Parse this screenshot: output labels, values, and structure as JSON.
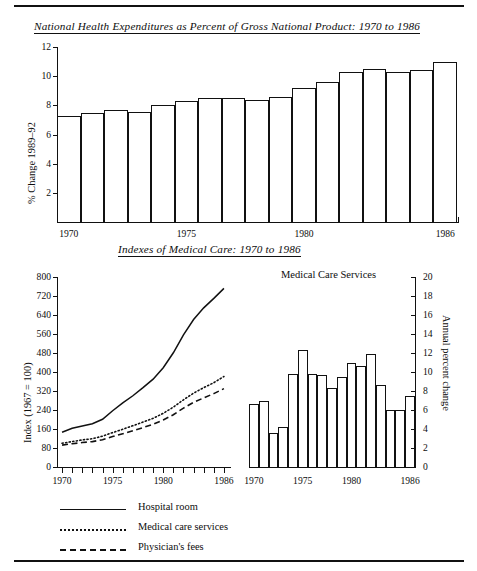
{
  "document": {
    "rule_top": "horizontal-rule",
    "rule_bottom": "horizontal-rule"
  },
  "figure1": {
    "title": "National Health Expenditures as Percent of Gross National Product: 1970 to 1986",
    "ylabel": "% Change 1989–92",
    "ytick_labels": [
      "12",
      "10",
      "8",
      "6",
      "4",
      "2"
    ],
    "xtick_labels": [
      "1970",
      "1975",
      "1980",
      "1986"
    ]
  },
  "figure2": {
    "title": "Indexes of Medical Care: 1970 to 1986",
    "left": {
      "ylabel": "Index (1967 = 100)",
      "ytick_labels": [
        "800",
        "720",
        "640",
        "560",
        "480",
        "400",
        "320",
        "240",
        "160",
        "80",
        "0"
      ],
      "xtick_labels": [
        "1970",
        "1975",
        "1980",
        "1986"
      ]
    },
    "right": {
      "subtitle": "Medical Care Services",
      "ylabel": "Annual percent change",
      "ytick_labels": [
        "20",
        "18",
        "16",
        "14",
        "12",
        "10",
        "8",
        "6",
        "4",
        "2",
        "0"
      ],
      "xtick_labels": [
        "1970",
        "1975",
        "1980",
        "1986"
      ]
    },
    "legend": [
      {
        "label": "Hospital room",
        "style": "solid"
      },
      {
        "label": "Medical care services",
        "style": "dotted"
      },
      {
        "label": "Physician's fees",
        "style": "dashed"
      }
    ]
  },
  "chart_data": [
    {
      "type": "bar",
      "title": "National Health Expenditures as Percent of Gross National Product: 1970 to 1986",
      "xlabel": "",
      "ylabel": "% Change 1989-92",
      "ylim": [
        0,
        12
      ],
      "yticks": [
        2,
        4,
        6,
        8,
        10,
        12
      ],
      "grid": false,
      "categories": [
        1970,
        1971,
        1972,
        1973,
        1974,
        1975,
        1976,
        1977,
        1978,
        1979,
        1980,
        1981,
        1982,
        1983,
        1984,
        1985,
        1986
      ],
      "values": [
        7.3,
        7.5,
        7.7,
        7.55,
        8.0,
        8.3,
        8.5,
        8.5,
        8.35,
        8.6,
        9.2,
        9.6,
        10.3,
        10.5,
        10.3,
        10.4,
        11.0
      ],
      "xtick_labels": [
        "1970",
        "1975",
        "1980",
        "1986"
      ]
    },
    {
      "type": "line",
      "title": "Indexes of Medical Care: 1970 to 1986",
      "xlabel": "",
      "ylabel": "Index (1967 = 100)",
      "ylim": [
        0,
        800
      ],
      "yticks": [
        0,
        80,
        160,
        240,
        320,
        400,
        480,
        560,
        640,
        720,
        800
      ],
      "grid": false,
      "legend_position": "below",
      "x": [
        1970,
        1971,
        1972,
        1973,
        1974,
        1975,
        1976,
        1977,
        1978,
        1979,
        1980,
        1981,
        1982,
        1983,
        1984,
        1985,
        1986
      ],
      "series": [
        {
          "name": "Hospital room",
          "style": "solid",
          "values": [
            146,
            163,
            173,
            182,
            201,
            237,
            270,
            300,
            334,
            370,
            418,
            481,
            556,
            621,
            670,
            710,
            752
          ]
        },
        {
          "name": "Medical care services",
          "style": "dotted",
          "values": [
            100,
            107,
            114,
            119,
            130,
            145,
            159,
            174,
            189,
            205,
            226,
            252,
            283,
            311,
            334,
            355,
            381
          ]
        },
        {
          "name": "Physician's fees",
          "style": "dashed",
          "values": [
            92,
            98,
            103,
            107,
            115,
            128,
            140,
            153,
            166,
            180,
            198,
            220,
            248,
            272,
            291,
            309,
            330
          ]
        }
      ],
      "xtick_labels": [
        "1970",
        "1975",
        "1980",
        "1986"
      ]
    },
    {
      "type": "bar",
      "title": "Medical Care Services",
      "xlabel": "",
      "ylabel": "Annual percent change",
      "ylim": [
        0,
        20
      ],
      "yticks": [
        0,
        2,
        4,
        6,
        8,
        10,
        12,
        14,
        16,
        18,
        20
      ],
      "grid": false,
      "categories": [
        1970,
        1971,
        1972,
        1973,
        1974,
        1975,
        1976,
        1977,
        1978,
        1979,
        1980,
        1981,
        1982,
        1983,
        1984,
        1985,
        1986
      ],
      "values": [
        6.6,
        6.9,
        3.6,
        4.2,
        9.8,
        12.3,
        9.8,
        9.7,
        8.3,
        9.5,
        10.9,
        10.6,
        11.9,
        8.6,
        6.0,
        6.0,
        7.5
      ],
      "xtick_labels": [
        "1970",
        "1975",
        "1980",
        "1986"
      ]
    }
  ]
}
